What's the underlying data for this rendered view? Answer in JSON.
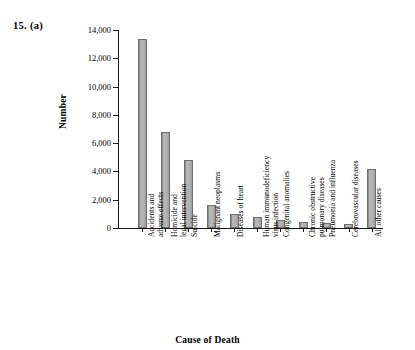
{
  "figure": {
    "label": "15.  (a)"
  },
  "chart_data": {
    "type": "bar",
    "title": "",
    "xlabel": "Cause of Death",
    "ylabel": "Number",
    "ylim": [
      0,
      14000
    ],
    "ytick_labels": [
      "14,000",
      "12,000",
      "10,000",
      "8,000",
      "6,000",
      "4,000",
      "2,000",
      "0"
    ],
    "ytick_values": [
      14000,
      12000,
      10000,
      8000,
      6000,
      4000,
      2000,
      0
    ],
    "grid": false,
    "legend": "none",
    "categories": [
      "Accidents and adverse effects",
      "Homicide and legal intervention",
      "Suicide",
      "Malignant neoplasms",
      "Diseases of heart",
      "Human immunodeficiency virus infection",
      "Congenital anomalies",
      "Chronic obstructive pulmonary diseases",
      "Pneumonia and influenza",
      "Cerebrovascular diseases",
      "All other causes"
    ],
    "category_lines": [
      [
        "Accidents and",
        "adverse effects"
      ],
      [
        "Homicide and",
        "legal intervention"
      ],
      [
        "Suicide"
      ],
      [
        "Malignant neoplasms"
      ],
      [
        "Diseases of heart"
      ],
      [
        "Human immunodeficiency",
        "virus infection"
      ],
      [
        "Congenital anomalies"
      ],
      [
        "Chronic obstructive",
        "pulmonary diseases"
      ],
      [
        "Pneumonia and influenza"
      ],
      [
        "Cerebrovascular diseases"
      ],
      [
        "All other causes"
      ]
    ],
    "values": [
      13400,
      6800,
      4800,
      1600,
      1000,
      800,
      600,
      400,
      350,
      300,
      4200
    ],
    "bar_color": "#a9a9a9",
    "bar_edge_color": "#6e6e6e",
    "axis_color": "#1a1a1a"
  }
}
